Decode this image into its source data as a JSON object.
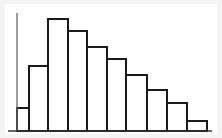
{
  "figure": {
    "name": "histogram-figure",
    "background_color": "#f4f4f4",
    "plot_background_color": "#ffffff",
    "line_color": "#1a1a1a",
    "axis_color": "#555555"
  },
  "chart_data": {
    "type": "bar",
    "title": "",
    "subtitle": "",
    "xlabel": "",
    "ylabel": "",
    "legend": [],
    "legend_position": "none",
    "grid": false,
    "axis_lines": [
      "left",
      "bottom"
    ],
    "tick_labels_x": [],
    "tick_labels_y": [],
    "annotations": [],
    "bar_fill_color": "#ffffff",
    "bar_edge_color": "#1a1a1a",
    "bar_edge_width": 1.6,
    "categories": [
      "1",
      "2",
      "3",
      "4",
      "5",
      "6",
      "7",
      "8",
      "9",
      "10"
    ],
    "values": [
      19,
      64,
      113,
      100,
      84,
      72,
      57,
      42,
      28,
      11
    ],
    "ylim": [
      0,
      120
    ],
    "xlim": [
      0,
      10
    ],
    "x_axis_start_px": 17,
    "x_axis_end_px": 212,
    "baseline_y_px": 131,
    "axis_top_y_px": 13,
    "bar_edges_px": [
      17,
      29,
      48,
      68,
      87,
      107,
      126,
      147,
      167,
      187,
      207
    ],
    "bar_top_y_px": [
      108,
      66,
      19,
      31,
      47,
      59,
      75,
      90,
      103,
      121
    ]
  }
}
